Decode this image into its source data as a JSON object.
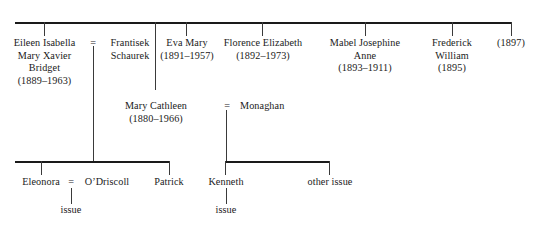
{
  "diagram": {
    "type": "family-tree",
    "generations": [
      {
        "id": "gen1",
        "nodes": [
          {
            "name": "Eileen Isabella",
            "name2": "Mary Xavier",
            "name3": "Bridget",
            "dates": "(1889–1963)"
          },
          {
            "name": "Frantisek",
            "name2": "Schaurek",
            "dates": ""
          },
          {
            "name": "Eva Mary",
            "dates": "(1891–1957)"
          },
          {
            "name": "Florence Elizabeth",
            "dates": "(1892–1973)"
          },
          {
            "name": "Mabel Josephine",
            "name2": "Anne",
            "dates": "(1893–1911)"
          },
          {
            "name": "Frederick",
            "name2": "William",
            "dates": "(1895)"
          },
          {
            "name": "",
            "dates": "(1897)"
          }
        ],
        "marriage_symbol": "="
      },
      {
        "id": "gen2",
        "nodes": [
          {
            "name": "Mary Cathleen",
            "dates": "(1880–1966)"
          },
          {
            "name": "Monaghan",
            "dates": ""
          }
        ],
        "marriage_symbol": "="
      },
      {
        "id": "gen3",
        "nodes": [
          {
            "name": "Eleonora",
            "dates": ""
          },
          {
            "name": "O’Driscoll",
            "dates": ""
          },
          {
            "name": "Patrick",
            "dates": ""
          },
          {
            "name": "Kenneth",
            "dates": ""
          },
          {
            "name": "other issue",
            "dates": ""
          }
        ],
        "marriage_symbol": "="
      }
    ],
    "issue_labels": {
      "left": "issue",
      "right": "issue"
    },
    "colors": {
      "text": "#1a1a1a",
      "rule": "#1a1a1a",
      "connector": "#3a3a3a",
      "background": "#ffffff"
    }
  }
}
